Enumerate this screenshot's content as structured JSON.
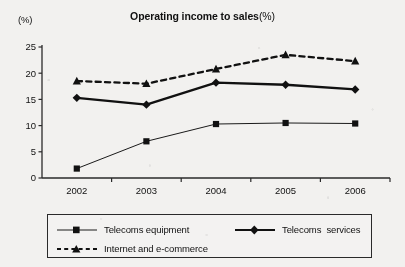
{
  "chart_data": {
    "type": "line",
    "title_main": "Operating income to sales",
    "title_paren": "(%)",
    "unit_label": "(%)",
    "xlabel": "",
    "ylabel": "",
    "categories": [
      "2002",
      "2003",
      "2004",
      "2005",
      "2006"
    ],
    "ylim": [
      0,
      25
    ],
    "yticks": [
      0,
      5,
      10,
      15,
      20,
      25
    ],
    "ytick_labels": [
      "0",
      "5",
      "10",
      "15",
      "20",
      "25"
    ],
    "grid": false,
    "legend_position": "below",
    "series": [
      {
        "name": "Telecoms equipment",
        "values": [
          1.8,
          7.0,
          10.3,
          10.5,
          10.4
        ],
        "marker": "square",
        "line_style": "solid",
        "line_width": "thin",
        "color": "#1a1a1a"
      },
      {
        "name": "Telecoms  services",
        "values": [
          15.3,
          14.0,
          18.2,
          17.8,
          16.9
        ],
        "marker": "diamond",
        "line_style": "solid",
        "line_width": "thick",
        "color": "#111111"
      },
      {
        "name": "Internet and e-commerce",
        "values": [
          18.5,
          18.0,
          20.8,
          23.5,
          22.3
        ],
        "marker": "triangle",
        "line_style": "dashed",
        "line_width": "thick",
        "color": "#111111"
      }
    ]
  },
  "legend": {
    "entries": [
      {
        "label": "Telecoms equipment"
      },
      {
        "label": "Telecoms  services"
      },
      {
        "label": "Internet and e-commerce"
      }
    ]
  }
}
